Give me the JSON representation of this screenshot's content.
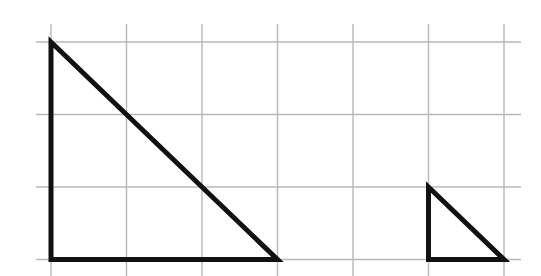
{
  "diagram": {
    "type": "grid-with-triangles",
    "grid": {
      "columns": 6,
      "rows": 3,
      "line_color": "#b8b8b8"
    },
    "shapes": [
      {
        "name": "large-right-triangle",
        "kind": "right-triangle",
        "vertices_grid_units": [
          [
            0,
            0
          ],
          [
            0,
            3
          ],
          [
            3,
            3
          ]
        ],
        "legs_units": [
          3,
          3
        ],
        "stroke_color": "#111111"
      },
      {
        "name": "small-right-triangle",
        "kind": "right-triangle",
        "vertices_grid_units": [
          [
            5,
            2
          ],
          [
            5,
            3
          ],
          [
            6,
            3
          ]
        ],
        "legs_units": [
          1,
          1
        ],
        "stroke_color": "#111111"
      }
    ]
  }
}
